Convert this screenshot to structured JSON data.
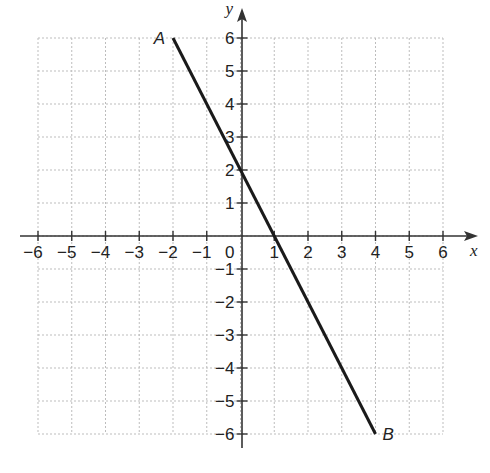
{
  "chart_data": {
    "type": "line",
    "title": "",
    "xlabel": "x",
    "ylabel": "y",
    "xlim": [
      -6,
      6
    ],
    "ylim": [
      -6,
      6
    ],
    "grid": true,
    "x_ticks": [
      -6,
      -5,
      -4,
      -3,
      -2,
      -1,
      0,
      1,
      2,
      3,
      4,
      5,
      6
    ],
    "y_ticks": [
      -6,
      -5,
      -4,
      -3,
      -2,
      -1,
      1,
      2,
      3,
      4,
      5,
      6
    ],
    "x_tick_labels": [
      "−6",
      "−5",
      "−4",
      "−3",
      "−2",
      "−1",
      "1",
      "2",
      "3",
      "4",
      "5",
      "6"
    ],
    "y_tick_labels": [
      "−6",
      "−5",
      "−4",
      "−3",
      "−2",
      "−1",
      "1",
      "2",
      "3",
      "4",
      "5",
      "6"
    ],
    "origin_label": "0",
    "series": [
      {
        "name": "AB",
        "points": [
          {
            "label": "A",
            "x": -2,
            "y": 6
          },
          {
            "label": "B",
            "x": 4,
            "y": -6
          }
        ]
      }
    ],
    "annotations": [
      {
        "text": "A",
        "x": -2,
        "y": 6
      },
      {
        "text": "B",
        "x": 4,
        "y": -6
      }
    ]
  },
  "colors": {
    "line": "#1a1a1a",
    "axis": "#333333",
    "grid": "#bdbdbd"
  }
}
